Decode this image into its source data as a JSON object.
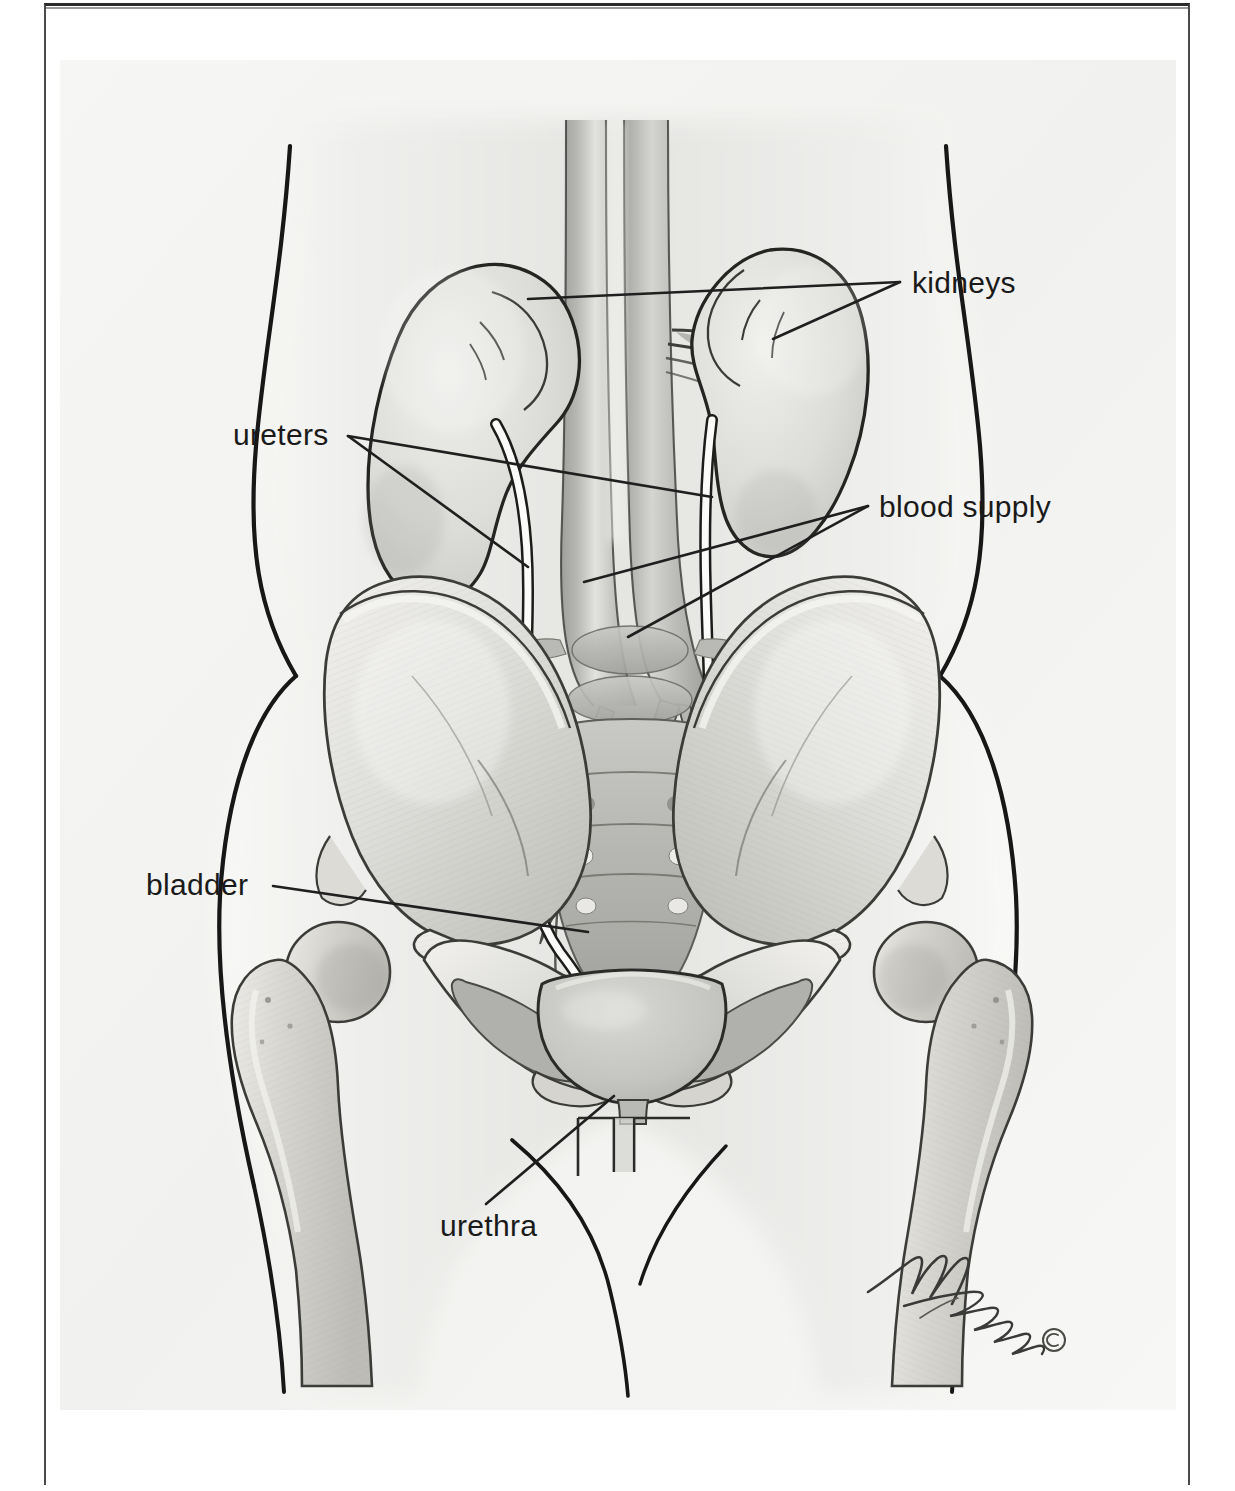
{
  "document": {
    "title": "Urinary System Anatomy",
    "frame": {
      "border_color": "#2b2b2b",
      "inner_rule_color": "#9a9a9a"
    }
  },
  "illustration": {
    "type": "medical-anatomical-drawing",
    "view": "anterior",
    "subject": "female urinary tract within the abdomen and pelvis",
    "style": "grayscale pencil and airbrush rendering",
    "background_color": "#f2f2f0",
    "line_color": "#2a2a2a",
    "organ_fill": "#c9c9c7",
    "bone_fill": "#e6e5e2",
    "structures": [
      "body outline (torso, hips, thighs)",
      "right kidney",
      "left kidney",
      "abdominal aorta",
      "inferior vena cava",
      "renal arteries",
      "renal veins",
      "right ureter",
      "left ureter",
      "common iliac arteries",
      "common iliac veins",
      "lumbar vertebrae",
      "sacrum",
      "right ilium",
      "left ilium",
      "pubic symphysis",
      "ischium",
      "right femur",
      "left femur",
      "urinary bladder",
      "urethra"
    ]
  },
  "labels": [
    {
      "id": "kidneys",
      "text": "kidneys",
      "x": 912,
      "y": 268,
      "leader_type": "double-branch",
      "points_to": [
        "right kidney",
        "left kidney"
      ]
    },
    {
      "id": "ureters",
      "text": "ureters",
      "x": 233,
      "y": 420,
      "leader_type": "double-branch",
      "points_to": [
        "right ureter",
        "left ureter"
      ]
    },
    {
      "id": "blood_supply",
      "text": "blood supply",
      "x": 879,
      "y": 492,
      "leader_type": "double-branch",
      "points_to": [
        "abdominal aorta",
        "inferior vena cava"
      ]
    },
    {
      "id": "bladder",
      "text": "bladder",
      "x": 146,
      "y": 870,
      "leader_type": "single",
      "points_to": [
        "urinary bladder"
      ]
    },
    {
      "id": "urethra",
      "text": "urethra",
      "x": 440,
      "y": 1211,
      "leader_type": "single",
      "points_to": [
        "urethra"
      ]
    }
  ],
  "credit": {
    "signature_text": "M. Graham",
    "copyright_symbol": "©",
    "style": "handwritten cursive"
  },
  "colors": {
    "label_text": "#1a1a1a",
    "leader_line": "#1f1f1f",
    "page_background": "#ffffff",
    "illustration_background": "#f2f2f0"
  }
}
